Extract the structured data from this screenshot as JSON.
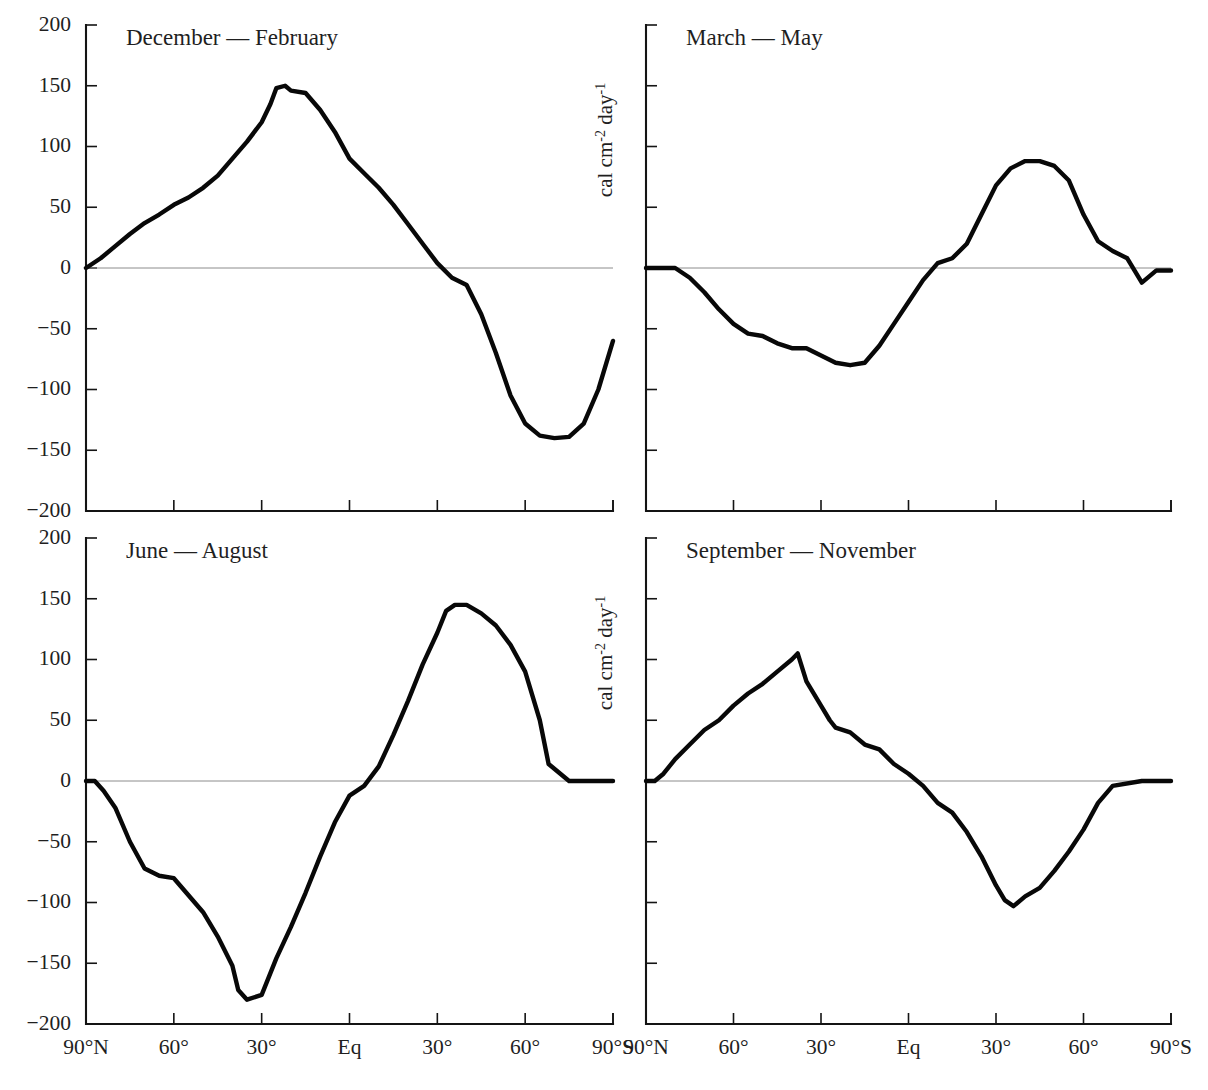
{
  "figure": {
    "background_color": "#ffffff",
    "curve_color": "#080808",
    "axis_color": "#141414",
    "zero_line_color": "#8c8c8c",
    "y_axis_unit": "cal cm",
    "y_axis_unit_sup1": "-2",
    "y_axis_unit_mid": " day",
    "y_axis_unit_sup2": "-1"
  },
  "axes": {
    "y_ticks": [
      200,
      150,
      100,
      50,
      0,
      -50,
      -100,
      -150,
      -200
    ],
    "y_tick_labels": [
      "200",
      "150",
      "100",
      "50",
      "0",
      "−50",
      "−100",
      "−150",
      "−200"
    ],
    "x_ticks": [
      90,
      60,
      30,
      0,
      -30,
      -60,
      -90
    ],
    "x_tick_labels": [
      "90°N",
      "60°",
      "30°",
      "Eq",
      "30°",
      "60°",
      "90°S"
    ],
    "ylim": [
      -200,
      200
    ],
    "xlim": [
      90,
      -90
    ],
    "grid": false
  },
  "chart_data": [
    {
      "type": "line",
      "title": "December — February",
      "panel": "top-left",
      "xlabel": "",
      "ylabel": "cal cm-2 day-1",
      "xlim": [
        90,
        -90
      ],
      "ylim": [
        -200,
        200
      ],
      "x": [
        90,
        85,
        80,
        75,
        70,
        65,
        60,
        55,
        50,
        45,
        40,
        35,
        30,
        27,
        25,
        22,
        20,
        15,
        10,
        5,
        0,
        -5,
        -10,
        -15,
        -20,
        -25,
        -30,
        -35,
        -40,
        -45,
        -50,
        -55,
        -60,
        -65,
        -70,
        -75,
        -80,
        -85,
        -90
      ],
      "y": [
        0,
        8,
        18,
        28,
        37,
        44,
        52,
        58,
        66,
        76,
        90,
        104,
        120,
        135,
        148,
        150,
        146,
        144,
        130,
        112,
        90,
        78,
        66,
        52,
        36,
        20,
        4,
        -8,
        -14,
        -38,
        -70,
        -105,
        -128,
        -138,
        -140,
        -139,
        -128,
        -100,
        -60
      ],
      "note": "values continue: rises to 0 at about 72S then flat"
    },
    {
      "type": "line",
      "title": "March — May",
      "panel": "top-right",
      "xlabel": "",
      "ylabel": "cal cm-2 day-1",
      "xlim": [
        90,
        -90
      ],
      "ylim": [
        -200,
        200
      ],
      "x": [
        90,
        85,
        80,
        75,
        70,
        65,
        60,
        55,
        50,
        45,
        40,
        35,
        30,
        25,
        20,
        15,
        10,
        5,
        0,
        -5,
        -10,
        -15,
        -20,
        -25,
        -30,
        -35,
        -40,
        -45,
        -50,
        -55,
        -60,
        -65,
        -70,
        -75,
        -80,
        -85,
        -90
      ],
      "y": [
        0,
        0,
        0,
        -8,
        -20,
        -34,
        -46,
        -54,
        -56,
        -62,
        -66,
        -66,
        -72,
        -78,
        -80,
        -78,
        -64,
        -46,
        -28,
        -10,
        4,
        8,
        20,
        44,
        68,
        82,
        88,
        88,
        84,
        72,
        44,
        22,
        14,
        8,
        -12,
        -2,
        -2
      ]
    },
    {
      "type": "line",
      "title": "June — August",
      "panel": "bottom-left",
      "xlabel": "",
      "ylabel": "cal cm-2 day-1",
      "xlim": [
        90,
        -90
      ],
      "ylim": [
        -200,
        200
      ],
      "x": [
        90,
        87,
        84,
        80,
        75,
        70,
        65,
        60,
        55,
        50,
        45,
        40,
        38,
        35,
        30,
        25,
        20,
        15,
        10,
        5,
        0,
        -5,
        -10,
        -15,
        -20,
        -25,
        -30,
        -33,
        -36,
        -40,
        -45,
        -50,
        -55,
        -60,
        -65,
        -68,
        -75,
        -85,
        -90
      ],
      "y": [
        0,
        0,
        -8,
        -22,
        -50,
        -72,
        -78,
        -80,
        -94,
        -108,
        -128,
        -152,
        -172,
        -180,
        -176,
        -146,
        -120,
        -92,
        -62,
        -34,
        -12,
        -4,
        12,
        38,
        66,
        96,
        122,
        140,
        145,
        145,
        138,
        128,
        112,
        90,
        50,
        14,
        0,
        0,
        0
      ]
    },
    {
      "type": "line",
      "title": "September — November",
      "panel": "bottom-right",
      "xlabel": "",
      "ylabel": "cal cm-2 day-1",
      "xlim": [
        90,
        -90
      ],
      "ylim": [
        -200,
        200
      ],
      "x": [
        90,
        87,
        84,
        80,
        75,
        70,
        65,
        60,
        55,
        50,
        45,
        40,
        38,
        35,
        30,
        27,
        25,
        20,
        15,
        10,
        5,
        0,
        -5,
        -10,
        -15,
        -20,
        -25,
        -30,
        -33,
        -36,
        -40,
        -45,
        -50,
        -55,
        -60,
        -65,
        -70,
        -80,
        -90
      ],
      "y": [
        0,
        0,
        6,
        18,
        30,
        42,
        50,
        62,
        72,
        80,
        90,
        100,
        105,
        82,
        62,
        50,
        44,
        40,
        30,
        26,
        14,
        6,
        -4,
        -18,
        -26,
        -42,
        -62,
        -86,
        -98,
        -103,
        -95,
        -88,
        -74,
        -58,
        -40,
        -18,
        -4,
        0,
        0
      ]
    }
  ]
}
